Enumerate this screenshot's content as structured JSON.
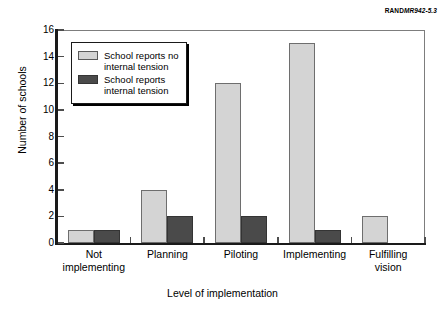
{
  "credit": {
    "brand": "RAND",
    "code": "MR942-5.3"
  },
  "chart_data": {
    "type": "bar",
    "title": "",
    "xlabel": "Level of implementation",
    "ylabel": "Number of schools",
    "categories": [
      "Not\nimplementing",
      "Planning",
      "Piloting",
      "Implementing",
      "Fulfilling\nvision"
    ],
    "series": [
      {
        "name": "School reports no\ninternal tension",
        "color": "#d4d4d4",
        "values": [
          1,
          4,
          12,
          15,
          2
        ]
      },
      {
        "name": "School reports\ninternal tension",
        "color": "#4a4a4a",
        "values": [
          1,
          2,
          2,
          1,
          0
        ]
      }
    ],
    "ylim": [
      0,
      16
    ],
    "yticks": [
      0,
      2,
      4,
      6,
      8,
      10,
      12,
      14,
      16
    ],
    "ytick_labels": [
      "0",
      "2",
      "4",
      "6",
      "8",
      "10",
      "12",
      "14",
      "16"
    ],
    "grid": false,
    "legend_position": "upper left"
  }
}
